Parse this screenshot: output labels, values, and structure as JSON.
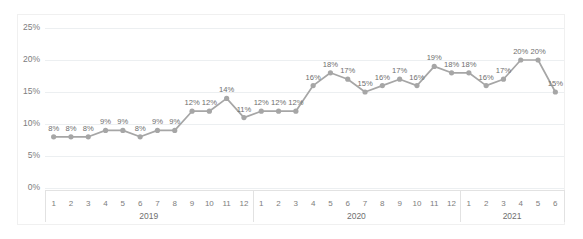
{
  "chart_data": {
    "type": "line",
    "title": "",
    "xlabel": "",
    "ylabel": "",
    "ylim": [
      0,
      25
    ],
    "y_tick_labels": [
      "0%",
      "5%",
      "10%",
      "15%",
      "20%",
      "25%"
    ],
    "y_tick_values": [
      0,
      5,
      10,
      15,
      20,
      25
    ],
    "grid": true,
    "legend": "none",
    "value_suffix": "%",
    "categories": [
      "1",
      "2",
      "3",
      "4",
      "5",
      "6",
      "7",
      "8",
      "9",
      "10",
      "11",
      "12",
      "1",
      "2",
      "3",
      "4",
      "5",
      "6",
      "7",
      "8",
      "9",
      "10",
      "11",
      "12",
      "1",
      "2",
      "3",
      "4",
      "5",
      "6"
    ],
    "values": [
      8,
      8,
      8,
      9,
      9,
      8,
      9,
      9,
      12,
      12,
      14,
      11,
      12,
      12,
      12,
      16,
      18,
      17,
      15,
      16,
      17,
      16,
      19,
      18,
      18,
      16,
      17,
      20,
      20,
      15
    ],
    "point_labels": [
      "8%",
      "8%",
      "8%",
      "9%",
      "9%",
      "8%",
      "9%",
      "9%",
      "12%",
      "12%",
      "14%",
      "11%",
      "12%",
      "12%",
      "12%",
      "16%",
      "18%",
      "17%",
      "15%",
      "16%",
      "17%",
      "16%",
      "19%",
      "18%",
      "18%",
      "16%",
      "17%",
      "20%",
      "20%",
      "15%"
    ],
    "group_labels": [
      "2019",
      "2020",
      "2021"
    ],
    "group_spans": [
      12,
      12,
      6
    ],
    "series": [
      {
        "name": "Series 1",
        "color": "#a6a6a6",
        "values": [
          8,
          8,
          8,
          9,
          9,
          8,
          9,
          9,
          12,
          12,
          14,
          11,
          12,
          12,
          12,
          16,
          18,
          17,
          15,
          16,
          17,
          16,
          19,
          18,
          18,
          16,
          17,
          20,
          20,
          15
        ]
      }
    ]
  },
  "colors": {
    "series": "#a6a6a6",
    "gridline": "#eceff1",
    "tick_text": "#7d7d7d",
    "label_text": "#6e6e6e",
    "frame": "#f0f0f0",
    "background": "#ffffff"
  }
}
